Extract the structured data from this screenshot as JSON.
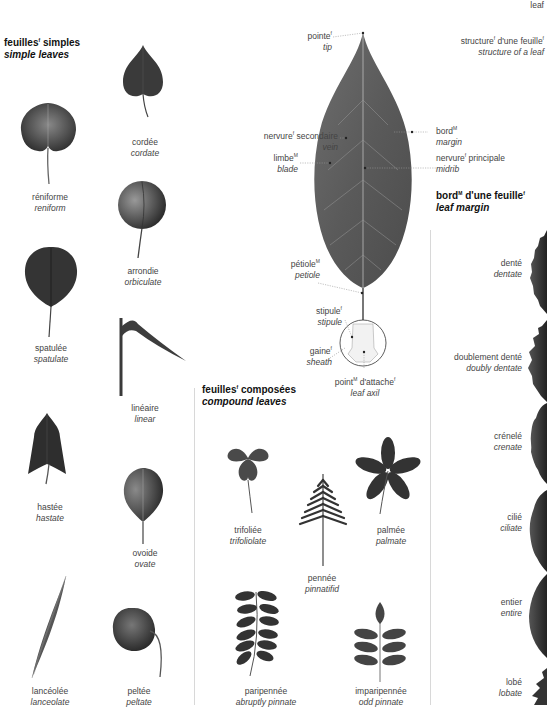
{
  "page": {
    "corner_label": "leaf"
  },
  "simple_leaves": {
    "title_fr": "feuilles",
    "title_fr_gender": "f",
    "title_fr_rest": "simples",
    "title_en": "simple leaves",
    "items": [
      {
        "fr": "cordée",
        "en": "cordate"
      },
      {
        "fr": "réniforme",
        "en": "reniform"
      },
      {
        "fr": "arrondie",
        "en": "orbiculate"
      },
      {
        "fr": "spatulée",
        "en": "spatulate"
      },
      {
        "fr": "linéaire",
        "en": "linear"
      },
      {
        "fr": "hastée",
        "en": "hastate"
      },
      {
        "fr": "ovoide",
        "en": "ovate"
      },
      {
        "fr": "lancéolée",
        "en": "lanceolate"
      },
      {
        "fr": "peltée",
        "en": "peltate"
      }
    ]
  },
  "structure": {
    "title_fr": "structure",
    "title_fr_gender": "f",
    "title_fr_mid": "d'une feuille",
    "title_fr_gender2": "f",
    "title_en": "structure of a leaf",
    "parts": {
      "tip": {
        "fr": "pointe",
        "g": "f",
        "en": "tip"
      },
      "vein": {
        "fr": "nervure",
        "g": "f",
        "fr2": "secondaire",
        "en": "vein"
      },
      "margin": {
        "fr": "bord",
        "g": "M",
        "en": "margin"
      },
      "blade": {
        "fr": "limbe",
        "g": "M",
        "en": "blade"
      },
      "midrib": {
        "fr": "nervure",
        "g": "f",
        "fr2": "principale",
        "en": "midrib"
      },
      "petiole": {
        "fr": "pétiole",
        "g": "M",
        "en": "petiole"
      },
      "stipule": {
        "fr": "stipule",
        "g": "f",
        "en": "stipule"
      },
      "sheath": {
        "fr": "gaine",
        "g": "f",
        "en": "sheath"
      },
      "axil": {
        "fr": "point",
        "g": "M",
        "fr2": "d'attache",
        "g2": "f",
        "en": "leaf axil"
      }
    }
  },
  "compound_leaves": {
    "title_fr": "feuilles",
    "title_fr_gender": "f",
    "title_fr_rest": "composées",
    "title_en": "compound leaves",
    "items": [
      {
        "fr": "trifoliée",
        "en": "trifoliolate"
      },
      {
        "fr": "palmée",
        "en": "palmate"
      },
      {
        "fr": "pennée",
        "en": "pinnatifid"
      },
      {
        "fr": "paripennée",
        "en": "abruptly pinnate"
      },
      {
        "fr": "imparipennée",
        "en": "odd pinnate"
      }
    ]
  },
  "leaf_margin": {
    "title_fr": "bord",
    "title_fr_gender": "M",
    "title_fr_mid": "d'une feuille",
    "title_fr_gender2": "f",
    "title_en": "leaf margin",
    "items": [
      {
        "fr": "denté",
        "en": "dentate"
      },
      {
        "fr": "doublement denté",
        "en": "doubly dentate"
      },
      {
        "fr": "crénelé",
        "en": "crenate"
      },
      {
        "fr": "cilié",
        "en": "ciliate"
      },
      {
        "fr": "entier",
        "en": "entire"
      },
      {
        "fr": "lobé",
        "en": "lobate"
      }
    ]
  }
}
